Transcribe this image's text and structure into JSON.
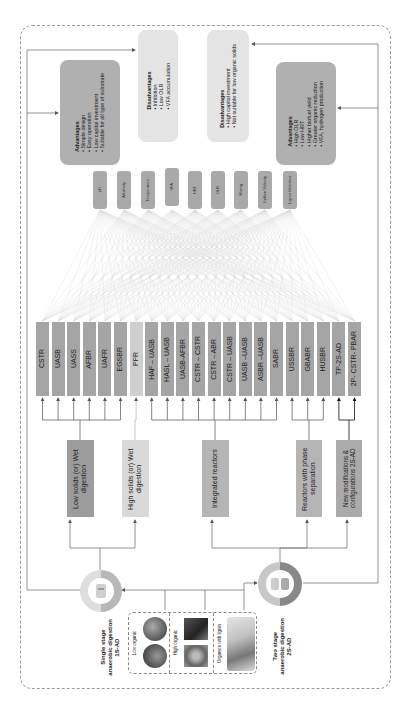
{
  "advantages_1s": {
    "title": "Advantages",
    "items": [
      "Simple design",
      "Easy operation",
      "Low capital investment",
      "Suitable for all type of substrate"
    ]
  },
  "disadvantages_1s": {
    "title": "Disadvantages",
    "items": [
      "Inhibition",
      "Low OLR",
      "VFA accumulation"
    ]
  },
  "disadvantages_2s": {
    "title": "Disadvantages",
    "items": [
      "High capital investment",
      "Not suitable for low organic solids"
    ]
  },
  "advantages_2s": {
    "title": "Advantages",
    "items": [
      "High OLR",
      "Low HRT",
      "Higher biofuel yield",
      "Greater organic reduction",
      "VFA, hydrogen production"
    ]
  },
  "parameters": [
    "pH",
    "Alkalinity",
    "Temperature",
    "VFA",
    "HRT",
    "OLR",
    "Mixing",
    "Upflow Velocity",
    "Lignin Inhibition"
  ],
  "reactors": [
    "CSTR",
    "UASB",
    "UASS",
    "AFBR",
    "UAFR",
    "EGSBR",
    "PFR",
    "HAF – UASB",
    "HASL – UASB",
    "UASB-AFBR",
    "CSTR – CSTR",
    "CSTR – ABR",
    "CSTR – UASB",
    "UASB –UASB",
    "ASBR –UASB",
    "SABR",
    "USSBR",
    "GBABR",
    "HUSBR",
    "TP-2S-AD",
    "2P- CSTR- PBAR"
  ],
  "categories": {
    "low_solids": "Low solids (or) Wet digestion",
    "high_solids": "High solids (or) Wet digestion",
    "integrated": "Integrated reactors",
    "phase_separation": "Reactors with phase separation",
    "new_modifications": "New modifications & configurations 2S-AD"
  },
  "stages": {
    "single": {
      "line1": "Single stage",
      "line2": "anaerobic digestion",
      "line3": "1S-AD"
    },
    "two": {
      "line1": "Two stage",
      "line2": "anaerobic digestion",
      "line3": "2S-AD"
    }
  },
  "substrates": [
    "Low organic",
    "High organic",
    "Organics with lignin"
  ],
  "colors": {
    "param_box": "#a9a9a9",
    "reactor_box": "#a5a5a5",
    "reactor_light": "#cfcfcf",
    "adv_box": "#b0b0b0",
    "disadv_box": "#e4e4e4",
    "cat_low": "#9c9c9c",
    "cat_high": "#d9d9d9",
    "cat_integrated": "#b5b5b5",
    "cat_phase": "#b5b5b5",
    "cat_new": "#aaaaaa",
    "line": "#777777"
  }
}
